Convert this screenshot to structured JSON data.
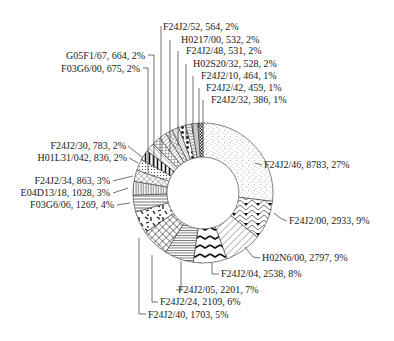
{
  "chart_data": {
    "type": "pie",
    "subtype": "donut",
    "title": "",
    "label_format": "{name}, {value}, {pct}",
    "total": 32646,
    "slices": [
      {
        "name": "F24J2/46",
        "value": 8783,
        "pct": "27%",
        "pattern": "stipple"
      },
      {
        "name": "F24J2/00",
        "value": 2933,
        "pct": "9%",
        "pattern": "chevron-arrows"
      },
      {
        "name": "H02N6/00",
        "value": 2797,
        "pct": "9%",
        "pattern": "diagonal-wide"
      },
      {
        "name": "F24J2/04",
        "value": 2538,
        "pct": "8%",
        "pattern": "zigzag"
      },
      {
        "name": "F24J2/05",
        "value": 2201,
        "pct": "7%",
        "pattern": "horizontal-dense"
      },
      {
        "name": "F24J2/24",
        "value": 2109,
        "pct": "6%",
        "pattern": "lattice"
      },
      {
        "name": "F24J2/40",
        "value": 1703,
        "pct": "5%",
        "pattern": "confetti"
      },
      {
        "name": "F03G6/06",
        "value": 1269,
        "pct": "4%",
        "pattern": "horizontal"
      },
      {
        "name": "E04D13/18",
        "value": 1028,
        "pct": "3%",
        "pattern": "vertical"
      },
      {
        "name": "F24J2/34",
        "value": 863,
        "pct": "3%",
        "pattern": "crosshatch-diag"
      },
      {
        "name": "H01L31/042",
        "value": 836,
        "pct": "2%",
        "pattern": "dots-small"
      },
      {
        "name": "F24J2/30",
        "value": 783,
        "pct": "2%",
        "pattern": "vertical-bold"
      },
      {
        "name": "F03G6/00",
        "value": 675,
        "pct": "2%",
        "pattern": "diagonal-back"
      },
      {
        "name": "G05F1/67",
        "value": 664,
        "pct": "2%",
        "pattern": "grid"
      },
      {
        "name": "F24J2/52",
        "value": 564,
        "pct": "2%",
        "pattern": "diagonal"
      },
      {
        "name": "H0217/00",
        "value": 532,
        "pct": "2%",
        "pattern": "crosshatch"
      },
      {
        "name": "F24J2/48",
        "value": 531,
        "pct": "2%",
        "pattern": "diagonal-dense"
      },
      {
        "name": "H02S20/32",
        "value": 528,
        "pct": "2%",
        "pattern": "dots-large"
      },
      {
        "name": "F24J2/10",
        "value": 464,
        "pct": "1%",
        "pattern": "wave"
      },
      {
        "name": "F24J2/42",
        "value": 459,
        "pct": "1%",
        "pattern": "vertical-thin"
      },
      {
        "name": "F24J2/32",
        "value": 386,
        "pct": "1%",
        "pattern": "checker"
      }
    ],
    "start_angle": "12 o'clock",
    "direction": "clockwise",
    "legend": "none (leader-line labels)"
  },
  "labels": [
    {
      "text": "F24J2/52, 564, 2%",
      "x": 163,
      "y": 30,
      "anchor": "start",
      "line": [
        [
          161,
          26
        ],
        [
          161,
          160
        ]
      ]
    },
    {
      "text": "H0217/00, 532, 2%",
      "x": 181,
      "y": 43,
      "anchor": "start",
      "line": [
        [
          170,
          40
        ],
        [
          170,
          152
        ]
      ]
    },
    {
      "text": "F24J2/48, 531, 2%",
      "x": 186,
      "y": 54,
      "anchor": "start",
      "line": [
        [
          178,
          51
        ],
        [
          178,
          146
        ]
      ]
    },
    {
      "text": "H02S20/32, 528, 2%",
      "x": 193,
      "y": 67,
      "anchor": "start",
      "line": [
        [
          186,
          64
        ],
        [
          186,
          140
        ]
      ]
    },
    {
      "text": "F24J2/10, 464, 1%",
      "x": 201,
      "y": 79,
      "anchor": "start",
      "line": [
        [
          193,
          76
        ],
        [
          193,
          134
        ]
      ]
    },
    {
      "text": "F24J2/42, 459, 1%",
      "x": 206,
      "y": 91,
      "anchor": "start",
      "line": [
        [
          199,
          88
        ],
        [
          199,
          128
        ]
      ]
    },
    {
      "text": "F24J2/32, 386, 1%",
      "x": 211,
      "y": 103,
      "anchor": "start",
      "line": [
        [
          203,
          100
        ],
        [
          203,
          123
        ]
      ]
    },
    {
      "text": "G05F1/67, 664, 2%",
      "x": 145,
      "y": 59,
      "anchor": "end",
      "line": [
        [
          148,
          55
        ],
        [
          154,
          55
        ],
        [
          154,
          168
        ]
      ]
    },
    {
      "text": "F03G6/00, 675, 2%",
      "x": 140,
      "y": 72,
      "anchor": "end",
      "line": [
        [
          143,
          68
        ],
        [
          148,
          68
        ],
        [
          148,
          172
        ]
      ]
    },
    {
      "text": "F24J2/46, 8783, 27%",
      "x": 264,
      "y": 168,
      "anchor": "start",
      "line": [
        [
          262,
          165
        ],
        [
          255,
          163
        ]
      ]
    },
    {
      "text": "F24J2/00, 2933, 9%",
      "x": 289,
      "y": 224,
      "anchor": "start",
      "line": [
        [
          287,
          221
        ],
        [
          280,
          218
        ],
        [
          274,
          213
        ]
      ]
    },
    {
      "text": "H02N6/00, 2797, 9%",
      "x": 262,
      "y": 261,
      "anchor": "start",
      "line": [
        [
          260,
          258
        ],
        [
          253,
          257
        ],
        [
          245,
          247
        ]
      ]
    },
    {
      "text": "F24J2/04, 2538, 8%",
      "x": 221,
      "y": 277,
      "anchor": "start",
      "line": [
        [
          219,
          274
        ],
        [
          212,
          274
        ],
        [
          212,
          263
        ]
      ]
    },
    {
      "text": "F24J2/05, 2201, 7%",
      "x": 178,
      "y": 293,
      "anchor": "start",
      "line": [
        [
          176,
          290
        ],
        [
          181,
          290
        ],
        [
          181,
          261
        ]
      ]
    },
    {
      "text": "F24J2/24, 2109, 6%",
      "x": 160,
      "y": 305,
      "anchor": "start",
      "line": [
        [
          158,
          302
        ],
        [
          152,
          302
        ],
        [
          152,
          255
        ]
      ]
    },
    {
      "text": "F24J2/40, 1703, 5%",
      "x": 148,
      "y": 318,
      "anchor": "start",
      "line": [
        [
          146,
          314
        ],
        [
          139,
          314
        ],
        [
          139,
          238
        ]
      ]
    },
    {
      "text": "F03G6/06, 1269, 4%",
      "x": 114,
      "y": 208,
      "anchor": "end",
      "line": [
        [
          117,
          205
        ],
        [
          130,
          203
        ]
      ]
    },
    {
      "text": "E04D13/18, 1028, 3%",
      "x": 110,
      "y": 196,
      "anchor": "end",
      "line": [
        [
          113,
          193
        ],
        [
          128,
          188
        ]
      ]
    },
    {
      "text": "F24J2/34, 863, 3%",
      "x": 110,
      "y": 184,
      "anchor": "end",
      "line": [
        [
          113,
          181
        ],
        [
          133,
          176
        ]
      ]
    },
    {
      "text": "H01L31/042, 836, 2%",
      "x": 127,
      "y": 161,
      "anchor": "end",
      "line": [
        [
          129,
          158
        ],
        [
          138,
          163
        ]
      ]
    },
    {
      "text": "F24J2/30, 783, 2%",
      "x": 126,
      "y": 149,
      "anchor": "end",
      "line": [
        [
          128,
          146
        ],
        [
          143,
          158
        ]
      ]
    }
  ],
  "geometry": {
    "cx": 203,
    "cy": 193,
    "r_outer": 70,
    "r_inner": 36
  },
  "colors": {
    "stroke": "#333333",
    "ink": "#222222",
    "background": "#ffffff"
  }
}
